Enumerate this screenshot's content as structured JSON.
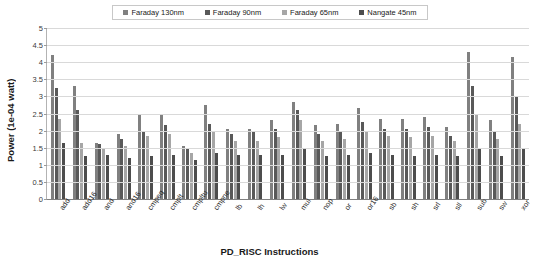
{
  "chart_data": {
    "type": "bar",
    "title": "",
    "xlabel": "PD_RISC Instructions",
    "ylabel": "Power (1e-04 watt)",
    "ylim": [
      0,
      5
    ],
    "ytick_step": 0.5,
    "yticks": [
      "0",
      "0.5",
      "1",
      "1.5",
      "2",
      "2.5",
      "3",
      "3.5",
      "4",
      "4.5",
      "5"
    ],
    "grid": true,
    "legend_position": "top-center",
    "categories": [
      "add",
      "add16",
      "and",
      "and16",
      "cmpeq",
      "cmplt",
      "cmpltu",
      "cmpne",
      "lb",
      "lh",
      "lw",
      "mul",
      "nop",
      "or",
      "or16",
      "sb",
      "sh",
      "srl",
      "sll",
      "sub",
      "sw",
      "xor"
    ],
    "series": [
      {
        "name": "Faraday 130nm",
        "color": "#808080",
        "values": [
          4.2,
          3.3,
          1.65,
          1.9,
          2.45,
          2.5,
          1.55,
          2.75,
          2.05,
          2.05,
          2.3,
          2.85,
          2.15,
          2.2,
          2.65,
          2.35,
          2.35,
          2.4,
          2.1,
          4.3,
          2.3,
          4.15
        ]
      },
      {
        "name": "Faraday 90nm",
        "color": "#595959",
        "values": [
          3.25,
          2.6,
          1.6,
          1.75,
          2.0,
          2.15,
          1.5,
          2.2,
          1.9,
          1.95,
          2.05,
          2.6,
          1.9,
          1.95,
          2.25,
          2.05,
          2.05,
          2.1,
          1.85,
          3.3,
          1.95,
          3.0
        ]
      },
      {
        "name": "Faraday 65nm",
        "color": "#a6a6a6",
        "values": [
          2.35,
          1.65,
          1.45,
          1.55,
          1.85,
          1.9,
          1.35,
          2.0,
          1.7,
          1.7,
          1.8,
          2.3,
          1.7,
          1.75,
          1.95,
          1.85,
          1.8,
          1.85,
          1.7,
          2.5,
          1.75,
          2.2
        ]
      },
      {
        "name": "Nangate 45nm",
        "color": "#4d4d4d",
        "values": [
          1.65,
          1.25,
          1.3,
          1.2,
          1.25,
          1.3,
          1.15,
          1.35,
          1.3,
          1.3,
          1.3,
          1.5,
          1.25,
          1.3,
          1.35,
          1.3,
          1.25,
          1.3,
          1.25,
          1.45,
          1.25,
          1.5
        ]
      }
    ]
  },
  "legend": {
    "items": [
      {
        "label": "Faraday 130nm",
        "color": "#808080"
      },
      {
        "label": "Faraday 90nm",
        "color": "#595959"
      },
      {
        "label": "Faraday 65nm",
        "color": "#a6a6a6"
      },
      {
        "label": "Nangate 45nm",
        "color": "#4d4d4d"
      }
    ]
  }
}
